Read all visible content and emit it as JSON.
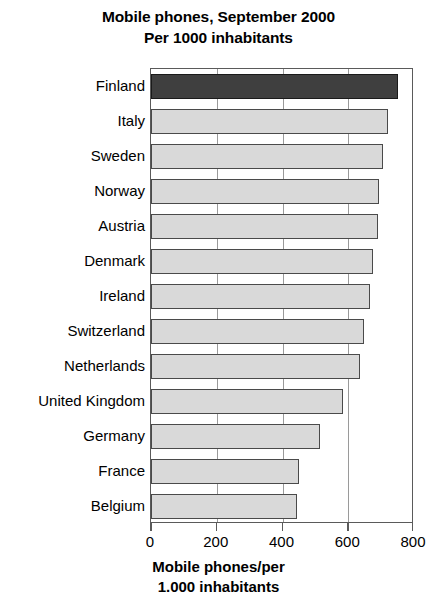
{
  "chart_data": {
    "type": "bar",
    "orientation": "horizontal",
    "title": "Mobile phones, September 2000\nPer 1000 inhabitants",
    "title_lines": [
      "Mobile phones, September 2000",
      "Per 1000 inhabitants"
    ],
    "xlabel": "Mobile phones/per\n1.000 inhabitants",
    "xlabel_lines": [
      "Mobile phones/per",
      "1.000 inhabitants"
    ],
    "ylabel": "",
    "categories": [
      "Finland",
      "Italy",
      "Sweden",
      "Norway",
      "Austria",
      "Denmark",
      "Ireland",
      "Switzerland",
      "Netherlands",
      "United Kingdom",
      "Germany",
      "France",
      "Belgium"
    ],
    "values": [
      750,
      720,
      705,
      693,
      690,
      675,
      665,
      648,
      637,
      583,
      515,
      450,
      445
    ],
    "xlim": [
      0,
      800
    ],
    "xticks": [
      0,
      200,
      400,
      600,
      800
    ],
    "xtick_labels": [
      "0",
      "200",
      "400",
      "600",
      "800"
    ],
    "grid": "vertical",
    "legend": "none",
    "highlight_index": 0,
    "colors": {
      "bar_fill": "#d9d9d9",
      "bar_edge": "#4a4a4a",
      "highlight_fill": "#3f3f3f",
      "highlight_edge": "#1a1a1a",
      "gridline": "#9a9a9a",
      "frame": "#5a5a5a",
      "background": "#ffffff",
      "text": "#000000"
    }
  }
}
